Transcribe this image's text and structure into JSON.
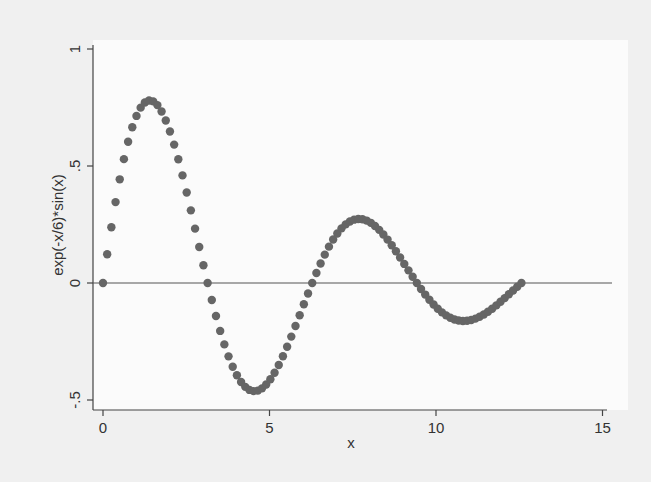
{
  "chart_data": {
    "type": "scatter",
    "title": "",
    "xlabel": "x",
    "ylabel": "exp(-x/6)*sin(x)",
    "xlim": [
      0,
      15
    ],
    "ylim": [
      -0.5,
      1
    ],
    "xticks": [
      0,
      5,
      10,
      15
    ],
    "xtick_labels": [
      "0",
      "5",
      "10",
      "15"
    ],
    "yticks": [
      -0.5,
      0,
      0.5,
      1
    ],
    "ytick_labels": [
      "-.5",
      "0",
      ".5",
      "1"
    ],
    "grid": false,
    "legend": null,
    "reference_line": {
      "y": 0,
      "color": "#555555"
    },
    "marker_color": "#666666",
    "function": "exp(-x/6)*sin(x)",
    "x_range": [
      0,
      12.566
    ],
    "n_points": 101,
    "series": [
      {
        "name": "exp(-x/6)*sin(x)",
        "x": [
          0.0,
          0.126,
          0.251,
          0.377,
          0.503,
          0.628,
          0.754,
          0.88,
          1.005,
          1.131,
          1.257,
          1.382,
          1.508,
          1.634,
          1.759,
          1.885,
          2.011,
          2.136,
          2.262,
          2.388,
          2.513,
          2.639,
          2.765,
          2.89,
          3.016,
          3.142,
          3.267,
          3.393,
          3.519,
          3.644,
          3.77,
          3.896,
          4.021,
          4.147,
          4.273,
          4.398,
          4.524,
          4.65,
          4.775,
          4.901,
          5.027,
          5.152,
          5.278,
          5.404,
          5.529,
          5.655,
          5.781,
          5.906,
          6.032,
          6.158,
          6.283,
          6.409,
          6.535,
          6.66,
          6.786,
          6.912,
          7.037,
          7.163,
          7.288,
          7.414,
          7.54,
          7.665,
          7.791,
          7.917,
          8.042,
          8.168,
          8.294,
          8.419,
          8.545,
          8.671,
          8.796,
          8.922,
          9.048,
          9.173,
          9.299,
          9.425,
          9.55,
          9.676,
          9.802,
          9.927,
          10.053,
          10.179,
          10.304,
          10.43,
          10.556,
          10.681,
          10.807,
          10.933,
          11.058,
          11.184,
          11.31,
          11.435,
          11.561,
          11.687,
          11.812,
          11.938,
          12.064,
          12.189,
          12.315,
          12.441,
          12.566
        ],
        "y": [
          0.0,
          0.122,
          0.24,
          0.345,
          0.443,
          0.531,
          0.607,
          0.672,
          0.723,
          0.762,
          0.787,
          0.799,
          0.797,
          0.783,
          0.756,
          0.717,
          0.668,
          0.61,
          0.543,
          0.469,
          0.39,
          0.307,
          0.222,
          0.136,
          0.05,
          0.0,
          -0.05,
          -0.1,
          -0.15,
          -0.215,
          -0.268,
          -0.316,
          -0.36,
          -0.397,
          -0.428,
          -0.451,
          -0.467,
          -0.475,
          -0.476,
          -0.468,
          -0.433,
          -0.416,
          -0.393,
          -0.363,
          -0.328,
          -0.289,
          -0.245,
          -0.199,
          -0.151,
          -0.101,
          0.0,
          0.015,
          0.05,
          0.085,
          0.117,
          0.148,
          0.175,
          0.199,
          0.219,
          0.235,
          0.247,
          0.254,
          0.258,
          0.257,
          0.252,
          0.244,
          0.232,
          0.217,
          0.2,
          0.18,
          0.158,
          0.135,
          0.111,
          0.086,
          0.061,
          0.0,
          -0.01,
          -0.03,
          -0.055,
          -0.078,
          -0.098,
          -0.117,
          -0.133,
          -0.147,
          -0.158,
          -0.166,
          -0.171,
          -0.174,
          -0.173,
          -0.17,
          -0.164,
          -0.156,
          -0.146,
          -0.134,
          -0.12,
          -0.105,
          -0.089,
          -0.072,
          -0.055,
          -0.037,
          0.0
        ]
      }
    ]
  }
}
